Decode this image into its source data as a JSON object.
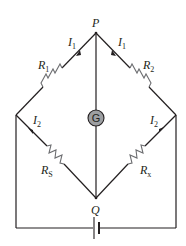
{
  "diagram": {
    "nodes": {
      "top": "P",
      "bottom": "Q"
    },
    "galvanometer": {
      "label": "G"
    },
    "resistors": {
      "top_left": {
        "symbol": "R",
        "sub": "1"
      },
      "top_right": {
        "symbol": "R",
        "sub": "2"
      },
      "bottom_left": {
        "symbol": "R",
        "sub": "S"
      },
      "bottom_right": {
        "symbol": "R",
        "sub": "x"
      }
    },
    "currents": {
      "top_left": {
        "symbol": "I",
        "sub": "1"
      },
      "top_right": {
        "symbol": "I",
        "sub": "1"
      },
      "bottom_left": {
        "symbol": "I",
        "sub": "2"
      },
      "bottom_right": {
        "symbol": "I",
        "sub": "2"
      }
    },
    "source": {
      "type": "battery"
    },
    "colors": {
      "wire": "#231f20",
      "resistor": "#6d6e71",
      "galvanometer_fill": "#9d9fa2"
    }
  }
}
